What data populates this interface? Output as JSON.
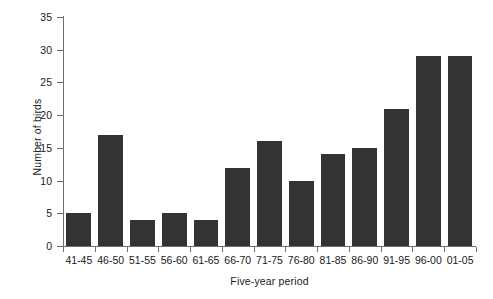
{
  "chart_data": {
    "type": "bar",
    "title": "",
    "subtitle": "",
    "xlabel": "Five-year period",
    "ylabel": "Number of birds",
    "categories": [
      "41-45",
      "46-50",
      "51-55",
      "56-60",
      "61-65",
      "66-70",
      "71-75",
      "76-80",
      "81-85",
      "86-90",
      "91-95",
      "96-00",
      "01-05"
    ],
    "values": [
      5,
      17,
      4,
      5,
      4,
      12,
      16,
      10,
      14,
      15,
      21,
      29,
      29
    ],
    "ylim": [
      0,
      35
    ],
    "yticks": [
      0,
      5,
      10,
      15,
      20,
      25,
      30,
      35
    ],
    "ytick_labels": [
      "0",
      "5",
      "10",
      "15",
      "20",
      "25",
      "30",
      "35"
    ],
    "grid": false,
    "legend": null,
    "legend_position": "none",
    "bar_color": "#333333",
    "axis_color": "#6e6e6e",
    "background_color": "#ffffff",
    "annotations": []
  }
}
